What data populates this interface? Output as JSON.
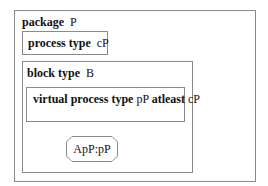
{
  "diagram": {
    "package": {
      "keyword": "package",
      "name": "P"
    },
    "process_type": {
      "keyword": "process type",
      "name": "cP"
    },
    "block_type": {
      "keyword": "block type",
      "name": "B"
    },
    "virtual_process_type": {
      "keyword": "virtual process type",
      "name": "pP",
      "constraint_keyword": "atleast",
      "constraint_name": "cP"
    },
    "process_instance": {
      "label": "ApP:pP"
    },
    "colors": {
      "border": "#8a8a8a",
      "text": "#111111",
      "background": "#ffffff"
    }
  }
}
